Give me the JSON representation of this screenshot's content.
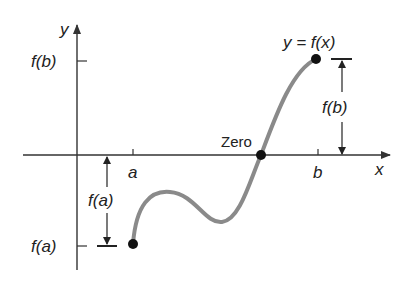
{
  "diagram": {
    "axes": {
      "x_label": "x",
      "y_label": "y"
    },
    "ticks": {
      "x": [
        {
          "label": "a"
        },
        {
          "label": "b"
        }
      ],
      "y": [
        {
          "label": "f(b)"
        },
        {
          "label": "f(a)"
        }
      ]
    },
    "curve": {
      "label": "y = f(x)",
      "color": "#888888"
    },
    "zero_label": "Zero",
    "measure_fa": "f(a)",
    "measure_fb": "f(b)",
    "colors": {
      "axis": "#333333",
      "point": "#111111",
      "curve": "#8a8a8a",
      "text": "#222222"
    }
  }
}
